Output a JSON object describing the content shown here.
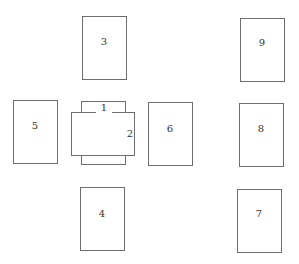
{
  "diagram": {
    "cards": [
      {
        "id": "1",
        "label": "1",
        "orientation": "vertical",
        "x": 81,
        "y": 101,
        "w": 45,
        "h": 64
      },
      {
        "id": "2",
        "label": "2",
        "orientation": "horizontal",
        "x": 71,
        "y": 112,
        "w": 64,
        "h": 44
      },
      {
        "id": "3",
        "label": "3",
        "orientation": "vertical",
        "x": 82,
        "y": 16,
        "w": 45,
        "h": 64
      },
      {
        "id": "4",
        "label": "4",
        "orientation": "vertical",
        "x": 80,
        "y": 187,
        "w": 45,
        "h": 64
      },
      {
        "id": "5",
        "label": "5",
        "orientation": "vertical",
        "x": 13,
        "y": 100,
        "w": 45,
        "h": 64
      },
      {
        "id": "6",
        "label": "6",
        "orientation": "vertical",
        "x": 148,
        "y": 102,
        "w": 45,
        "h": 64
      },
      {
        "id": "7",
        "label": "7",
        "orientation": "vertical",
        "x": 237,
        "y": 189,
        "w": 45,
        "h": 64
      },
      {
        "id": "8",
        "label": "8",
        "orientation": "vertical",
        "x": 239,
        "y": 103,
        "w": 45,
        "h": 64
      },
      {
        "id": "9",
        "label": "9",
        "orientation": "vertical",
        "x": 240,
        "y": 18,
        "w": 45,
        "h": 64
      }
    ]
  }
}
